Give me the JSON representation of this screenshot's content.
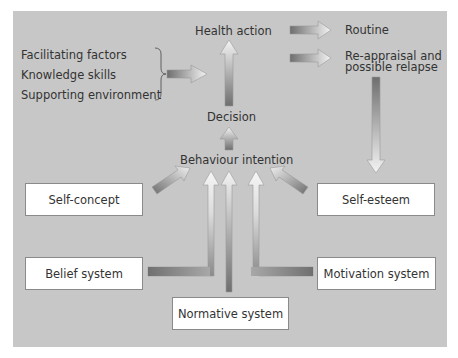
{
  "diagram": {
    "nodes": {
      "health_action": "Health action",
      "routine": "Routine",
      "reappraisal_line1": "Re-appraisal and",
      "reappraisal_line2": "possible relapse",
      "decision": "Decision",
      "behaviour_intention": "Behaviour intention",
      "self_concept": "Self-concept",
      "self_esteem": "Self-esteem",
      "belief_system": "Belief system",
      "motivation_system": "Motivation system",
      "normative_system": "Normative system"
    },
    "factors": [
      "Facilitating factors",
      "Knowledge skills",
      "Supporting environment"
    ],
    "edges": [
      {
        "from": "factors",
        "to": "health_action"
      },
      {
        "from": "decision",
        "to": "health_action"
      },
      {
        "from": "behaviour_intention",
        "to": "decision"
      },
      {
        "from": "health_action",
        "to": "routine"
      },
      {
        "from": "health_action",
        "to": "reappraisal"
      },
      {
        "from": "reappraisal",
        "to": "self_esteem"
      },
      {
        "from": "self_concept",
        "to": "behaviour_intention"
      },
      {
        "from": "self_esteem",
        "to": "behaviour_intention"
      },
      {
        "from": "belief_system",
        "to": "behaviour_intention"
      },
      {
        "from": "normative_system",
        "to": "behaviour_intention"
      },
      {
        "from": "motivation_system",
        "to": "behaviour_intention"
      }
    ],
    "colors": {
      "background": "#c7c7c7",
      "box_fill": "#ffffff",
      "arrow_dark": "#6e6e6e",
      "arrow_light": "#f4f4f4",
      "text": "#333333"
    }
  }
}
